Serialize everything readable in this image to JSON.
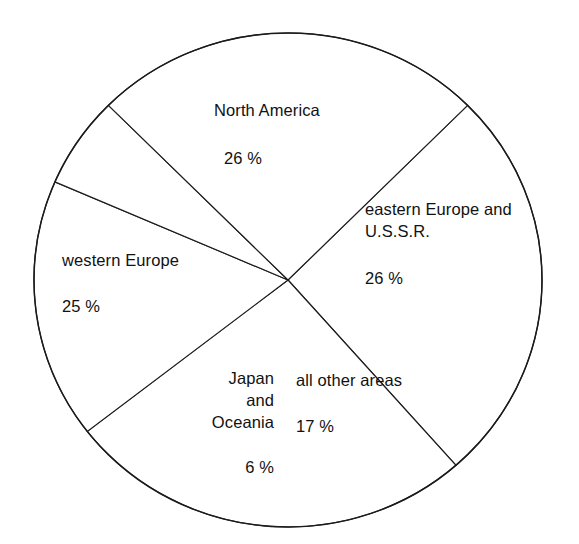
{
  "chart_data": {
    "type": "pie",
    "title": "",
    "subtitle": "",
    "xlabel": "",
    "ylabel": "",
    "unit": "%",
    "legend": "none",
    "grid": false,
    "total": 100,
    "categories": [
      "North America",
      "eastern Europe and U.S.S.R.",
      "all other areas",
      "Japan and Oceania",
      "western Europe"
    ],
    "values": [
      26,
      26,
      17,
      6,
      25
    ],
    "slices": [
      {
        "label": "North America",
        "label_lines": "North America",
        "value": 26,
        "value_text": "26 %",
        "start_angle_deg": 45,
        "end_angle_deg": -48.6,
        "fill": "#ffffff",
        "stroke": "#1b1b1b"
      },
      {
        "label": "eastern Europe and U.S.S.R.",
        "label_lines": "eastern Europe and\nU.S.S.R.",
        "value": 26,
        "value_text": "26 %",
        "start_angle_deg": 45,
        "end_angle_deg": -48.6,
        "fill": "#ffffff",
        "stroke": "#1b1b1b"
      },
      {
        "label": "all other areas",
        "label_lines": "all other areas",
        "value": 17,
        "value_text": "17 %",
        "start_angle_deg": -48.6,
        "end_angle_deg": -109.8,
        "fill": "#ffffff",
        "stroke": "#1b1b1b"
      },
      {
        "label": "Japan and Oceania",
        "label_lines": "Japan\nand\nOceania",
        "value": 6,
        "value_text": "6 %",
        "start_angle_deg": -109.8,
        "end_angle_deg": -131.4,
        "fill": "#ffffff",
        "stroke": "#1b1b1b"
      },
      {
        "label": "western Europe",
        "label_lines": "western Europe",
        "value": 25,
        "value_text": "25 %",
        "start_angle_deg": -131.4,
        "end_angle_deg": -221.4,
        "fill": "#ffffff",
        "stroke": "#1b1b1b"
      }
    ],
    "geometry": {
      "center_x": 288,
      "center_y": 280,
      "radius_x": 254,
      "radius_y": 247,
      "start_angle_deg": 45
    },
    "colors": {
      "background": "#ffffff",
      "outline": "#1b1b1b",
      "divider": "#1b1b1b",
      "text": "#111111"
    }
  },
  "labels": {
    "north_america": {
      "name": "North America",
      "value": "26 %"
    },
    "eastern_europe": {
      "name": "eastern Europe and\nU.S.S.R.",
      "value": "26 %"
    },
    "western_europe": {
      "name": "western Europe",
      "value": "25 %"
    },
    "all_other_areas": {
      "name": "all other areas",
      "value": "17 %"
    },
    "japan_oceania": {
      "name": "Japan\nand\nOceania",
      "value": "6 %"
    }
  }
}
